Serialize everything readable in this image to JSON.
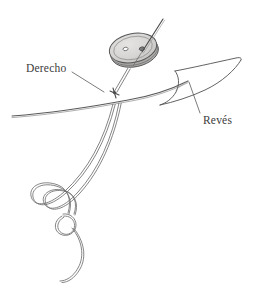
{
  "figure": {
    "background_color": "#ffffff",
    "line_color": "#5a5a5a",
    "text_color": "#3b3b3b",
    "width": 254,
    "height": 283
  },
  "labels": [
    {
      "id": "derecho",
      "text": "Derecho",
      "x": 26,
      "y": 63,
      "leader": {
        "x1": 72,
        "y1": 72,
        "x2": 104,
        "y2": 92
      }
    },
    {
      "id": "reves",
      "text": "Revés",
      "x": 203,
      "y": 115,
      "leader": {
        "x1": 200,
        "y1": 113,
        "x2": 189,
        "y2": 82
      }
    }
  ],
  "parts": {
    "button": {
      "name": "button",
      "fill_color": "#d6d4d2",
      "rim_color": "#b8b6b4",
      "outline_color": "#555555",
      "center_x": 133,
      "center_y": 48,
      "radius_x": 24,
      "radius_y": 15,
      "rotation_deg": -12,
      "holes": [
        {
          "cx": 126,
          "cy": 48,
          "r": 2.2
        },
        {
          "cx": 142,
          "cy": 52,
          "r": 2.4
        }
      ]
    },
    "needle": {
      "name": "needle",
      "x1": 162,
      "y1": 20,
      "x2": 141,
      "y2": 53
    },
    "fabric": {
      "name": "fabric",
      "edge_color": "#5a5a5a",
      "fold_label": "Revés"
    },
    "thread": {
      "name": "thread",
      "color": "#6a6a6a",
      "strand_count": 2,
      "has_knot": true
    }
  },
  "icon_names": {
    "button": "button-icon",
    "needle": "needle-icon",
    "thread": "thread-icon",
    "fabric": "fabric-icon",
    "knot": "knot-icon"
  }
}
